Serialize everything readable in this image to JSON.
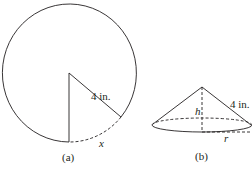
{
  "figure_a": {
    "caption": "(a)",
    "radius_label": "4 in.",
    "arc_label": "x"
  },
  "figure_b": {
    "caption": "(b)",
    "slant_label": "4 in.",
    "height_label": "h",
    "radius_label": "r"
  },
  "colors": {
    "stroke": "#231f20",
    "background": "#ffffff"
  }
}
